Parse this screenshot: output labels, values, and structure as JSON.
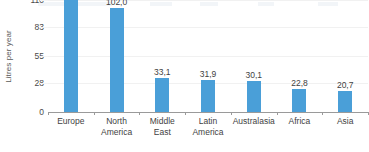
{
  "chart_data": {
    "type": "bar",
    "title": "",
    "xlabel": "",
    "ylabel": "Litres per year",
    "categories": [
      "Europe",
      "North America",
      "Middle East",
      "Latin America",
      "Australasia",
      "Africa",
      "Asia"
    ],
    "category_lines": [
      [
        "Europe"
      ],
      [
        "North",
        "America"
      ],
      [
        "Middle",
        "East"
      ],
      [
        "Latin",
        "America"
      ],
      [
        "Australasia"
      ],
      [
        "Africa"
      ],
      [
        "Asia"
      ]
    ],
    "values": [
      109.9,
      102.0,
      33.1,
      31.9,
      30.1,
      22.8,
      20.7
    ],
    "value_labels": [
      "109,9",
      "102,0",
      "33,1",
      "31,9",
      "30,1",
      "22,8",
      "20,7"
    ],
    "ylim": [
      0,
      110
    ],
    "yticks": [
      0,
      28,
      55,
      83,
      110
    ],
    "ytick_labels": [
      "0",
      "28",
      "55",
      "83",
      "110"
    ],
    "grid": true,
    "legend": false,
    "legend_position": "none",
    "bar_color": "#4a9fd8",
    "gridline_color": "#f1f1f1",
    "axis_color": "#9a9a9a",
    "text_color": "#3f3f3f"
  }
}
